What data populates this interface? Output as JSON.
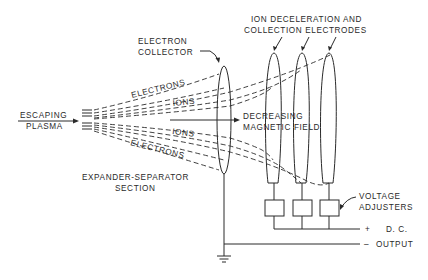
{
  "diagram": {
    "type": "schematic",
    "labels": {
      "escaping_line1": "ESCAPING",
      "escaping_line2": "PLASMA",
      "collector_line1": "ELECTRON",
      "collector_line2": "COLLECTOR",
      "electrodes_line1": "ION DECELERATION AND",
      "electrodes_line2": "COLLECTION ELECTRODES",
      "electrons_top": "ELECTRONS",
      "ions_top": "IONS",
      "ions_bottom": "IONS",
      "electrons_bottom": "ELECTRONS",
      "field_line1": "DECREASING",
      "field_line2": "MAGNETIC FIELD",
      "section_line1": "EXPANDER-SEPARATOR",
      "section_line2": "SECTION",
      "adjusters_line1": "VOLTAGE",
      "adjusters_line2": "ADJUSTERS",
      "plus": "+",
      "dc": "D. C.",
      "minus": "–",
      "output": "OUTPUT"
    },
    "components": [
      {
        "id": "plasma-source",
        "label": "ESCAPING PLASMA"
      },
      {
        "id": "electron-collector",
        "label": "ELECTRON COLLECTOR"
      },
      {
        "id": "electrode-1",
        "label": "ION DECELERATION AND COLLECTION ELECTRODE"
      },
      {
        "id": "electrode-2",
        "label": "ION DECELERATION AND COLLECTION ELECTRODE"
      },
      {
        "id": "electrode-3",
        "label": "ION DECELERATION AND COLLECTION ELECTRODE"
      },
      {
        "id": "voltage-adjuster-1",
        "label": "VOLTAGE ADJUSTER"
      },
      {
        "id": "voltage-adjuster-2",
        "label": "VOLTAGE ADJUSTER"
      },
      {
        "id": "voltage-adjuster-3",
        "label": "VOLTAGE ADJUSTER"
      },
      {
        "id": "ground",
        "label": "ground"
      }
    ],
    "flows": [
      {
        "from": "plasma-source",
        "to": "electron-collector",
        "label": "ELECTRONS"
      },
      {
        "from": "plasma-source",
        "to": "electrodes",
        "label": "IONS"
      }
    ],
    "terminals": [
      "+ D. C.",
      "– OUTPUT"
    ]
  }
}
